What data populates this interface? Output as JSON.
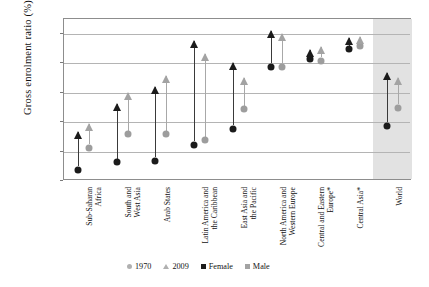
{
  "chart_data": {
    "type": "scatter",
    "title": "",
    "xlabel": "",
    "ylabel": "Gross enrolment ratio (%)",
    "ylim": [
      0,
      110
    ],
    "yticks": [
      0,
      20,
      40,
      60,
      80,
      100
    ],
    "grid": true,
    "legend_position": "bottom",
    "categories": [
      "Sub-Saharan Africa",
      "South and West Asia",
      "Arab States",
      "Latin America and the Caribbean",
      "East Asia and the Pacific",
      "North America and Western Europe",
      "Central and Eastern Europe*",
      "Central Asia*",
      "World"
    ],
    "series": [
      {
        "name": "Female 1970",
        "marker": "circle",
        "color": "#1b1b1b",
        "values": [
          10,
          15,
          16,
          27,
          38,
          80,
          85,
          92,
          40
        ]
      },
      {
        "name": "Female 2009",
        "marker": "triangle",
        "color": "#1b1b1b",
        "values": [
          33,
          52,
          64,
          95,
          80,
          102,
          89,
          97,
          73
        ]
      },
      {
        "name": "Male 1970",
        "marker": "circle",
        "color": "#9d9d9d",
        "values": [
          25,
          34,
          34,
          30,
          51,
          80,
          84,
          94,
          52
        ]
      },
      {
        "name": "Male 2009",
        "marker": "triangle",
        "color": "#a3a3a3",
        "values": [
          39,
          60,
          71,
          86,
          70,
          100,
          91,
          98,
          70
        ]
      }
    ],
    "highlight_region": {
      "label": "World",
      "shaded": true
    }
  },
  "axis": {
    "y_title": "Gross enrolment ratio (%)",
    "y_tick_labels": [
      "0",
      "20",
      "40",
      "60",
      "80",
      "100"
    ]
  },
  "categories": [
    {
      "lines": [
        "Sub-Saharan",
        "Africa"
      ]
    },
    {
      "lines": [
        "South and",
        "West Asia"
      ]
    },
    {
      "lines": [
        "Arab States"
      ]
    },
    {
      "lines": [
        "Latin America and",
        "the Caribbean"
      ]
    },
    {
      "lines": [
        "East Asia and",
        "the Pacific"
      ]
    },
    {
      "lines": [
        "North America and",
        "Western Europe"
      ]
    },
    {
      "lines": [
        "Central and Eastern",
        "Europe*"
      ]
    },
    {
      "lines": [
        "Central Asia*"
      ]
    },
    {
      "lines": [
        "World"
      ]
    }
  ],
  "legend": {
    "items": [
      {
        "label": "1970",
        "marker": "circle-icon",
        "color": "#b0b0b0"
      },
      {
        "label": "2009",
        "marker": "triangle-icon",
        "color": "#b0b0b0"
      },
      {
        "label": "Female",
        "marker": "square-icon",
        "color": "#1b1b1b"
      },
      {
        "label": "Male",
        "marker": "square-icon",
        "color": "#a3a3a3"
      }
    ]
  }
}
